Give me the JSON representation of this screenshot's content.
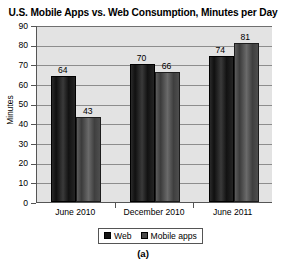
{
  "chart_data": {
    "type": "bar",
    "title": "U.S. Mobile Apps vs. Web Consumption, Minutes per Day",
    "xlabel": "",
    "ylabel": "Minutes",
    "categories": [
      "June 2010",
      "December 2010",
      "June 2011"
    ],
    "series": [
      {
        "name": "Web",
        "values": [
          64,
          70,
          74
        ],
        "color": "#151515"
      },
      {
        "name": "Mobile apps",
        "values": [
          43,
          66,
          81
        ],
        "color": "#4a4a4a"
      }
    ],
    "ylim": [
      0,
      90
    ],
    "y_ticks": [
      90,
      80,
      70,
      60,
      50,
      40,
      30,
      20,
      10,
      0
    ],
    "grid": "horizontal",
    "legend_position": "bottom",
    "data_labels": [
      "64",
      "43",
      "70",
      "66",
      "74",
      "81"
    ],
    "plot_background": "#e3e3e3"
  },
  "caption": "(a)",
  "legend": {
    "items": [
      {
        "label": "Web"
      },
      {
        "label": "Mobile apps"
      }
    ]
  }
}
